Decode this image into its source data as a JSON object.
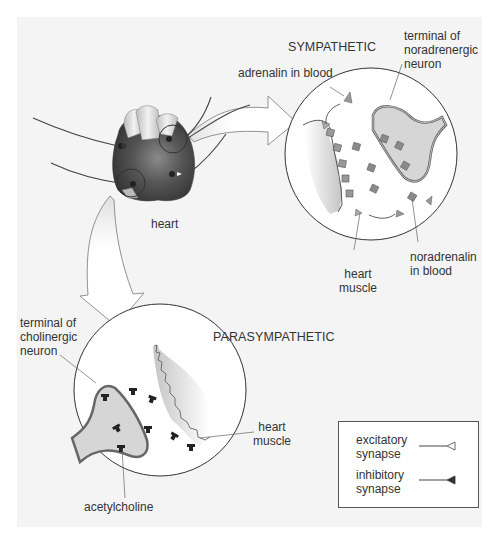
{
  "diagram": {
    "type": "autonomic innervation of the heart",
    "colors": {
      "background": "#f4f4f4",
      "line": "#444444",
      "heart_dark": "#4a4a4a",
      "heart_light": "#d8d8d8",
      "neuron_fill": "#d6d6d6",
      "vesicle": "#8a8a8a",
      "acetylcholine": "#222222"
    }
  },
  "heart": {
    "label": "heart"
  },
  "sympathetic": {
    "title": "SYMPATHETIC",
    "labels": {
      "adrenalin": "adrenalin in blood",
      "terminal_line1": "terminal of",
      "terminal_line2": "noradrenergic",
      "terminal_line3": "neuron",
      "muscle_line1": "heart",
      "muscle_line2": "muscle",
      "noradrenalin_line1": "noradrenalin",
      "noradrenalin_line2": "in blood"
    }
  },
  "parasympathetic": {
    "title": "PARASYMPATHETIC",
    "labels": {
      "terminal_line1": "terminal of",
      "terminal_line2": "cholinergic",
      "terminal_line3": "neuron",
      "muscle_line1": "heart",
      "muscle_line2": "muscle",
      "acetylcholine": "acetylcholine"
    }
  },
  "legend": {
    "items": [
      {
        "line1": "excitatory",
        "line2": "synapse",
        "symbol": "open-triangle"
      },
      {
        "line1": "inhibitory",
        "line2": "synapse",
        "symbol": "filled-triangle"
      }
    ]
  }
}
